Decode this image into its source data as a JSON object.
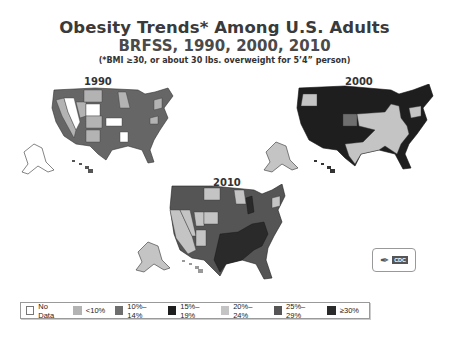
{
  "header": {
    "title": "Obesity Trends* Among U.S. Adults",
    "subtitle": "BRFSS, 1990, 2000, 2010",
    "footnote": "(*BMI ≥30, or about 30 lbs. overweight for 5’4” person)"
  },
  "maps": [
    {
      "year": "1990",
      "dominant_category": "10%–14%"
    },
    {
      "year": "2000",
      "dominant_category": "15%–19% / 20%–24%"
    },
    {
      "year": "2010",
      "dominant_category": "25%–29% / ≥30%"
    }
  ],
  "legend": {
    "items": [
      {
        "label": "No Data",
        "color": "#ffffff"
      },
      {
        "label": "<10%",
        "color": "#b3b3b3"
      },
      {
        "label": "10%–14%",
        "color": "#6e6e6e"
      },
      {
        "label": "15%–19%",
        "color": "#1e1e1e"
      },
      {
        "label": "20%–24%",
        "color": "#c4c4c4"
      },
      {
        "label": "25%–29%",
        "color": "#555555"
      },
      {
        "label": "≥30%",
        "color": "#2a2a2a"
      }
    ]
  },
  "logo": {
    "label": "CDC"
  }
}
